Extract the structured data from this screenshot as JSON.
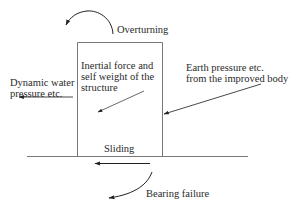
{
  "diagram": {
    "type": "free-body force diagram of a structure on improved ground",
    "labels": {
      "overturning": "Overturning",
      "inertial_line1": "Inertial force and",
      "inertial_line2": "self weight of the",
      "inertial_line3": "structure",
      "earth_line1": "Earth pressure etc.",
      "earth_line2": "from the improved body",
      "water_line1": "Dynamic water",
      "water_line2": "pressure etc.",
      "sliding": "Sliding",
      "bearing": "Bearing failure"
    },
    "colors": {
      "line": "#555555",
      "arrow": "#222222",
      "text": "#2a2a2a",
      "background": "#ffffff"
    }
  }
}
